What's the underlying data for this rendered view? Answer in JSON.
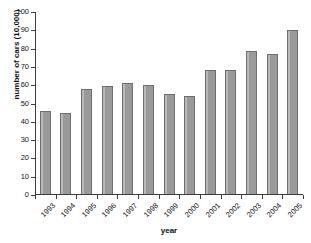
{
  "chart_data": {
    "type": "bar",
    "title": "",
    "xlabel": "year",
    "ylabel": "number of cars (10,000)",
    "categories": [
      "1993",
      "1994",
      "1995",
      "1996",
      "1997",
      "1998",
      "1999",
      "2000",
      "2001",
      "2002",
      "2003",
      "2004",
      "2005"
    ],
    "values": [
      45.2,
      44.0,
      57.5,
      58.8,
      60.9,
      59.7,
      54.5,
      53.5,
      67.6,
      67.5,
      78.4,
      76.4,
      89.5
    ],
    "ylim": [
      0,
      100
    ],
    "yticks": [
      0,
      10,
      20,
      30,
      40,
      50,
      60,
      70,
      80,
      90,
      100
    ],
    "ytick_labels": [
      "0",
      "10",
      "20",
      "30",
      "40",
      "50",
      "60",
      "70",
      "80",
      "90",
      "100"
    ],
    "grid": false,
    "legend": null,
    "bar_color": "#9a9a9a",
    "bar_edge_color": "#6d6d6d",
    "axis_color": "#3d3d3d",
    "background_color": "#ffffff",
    "x_tick_label_rotation": -45
  }
}
